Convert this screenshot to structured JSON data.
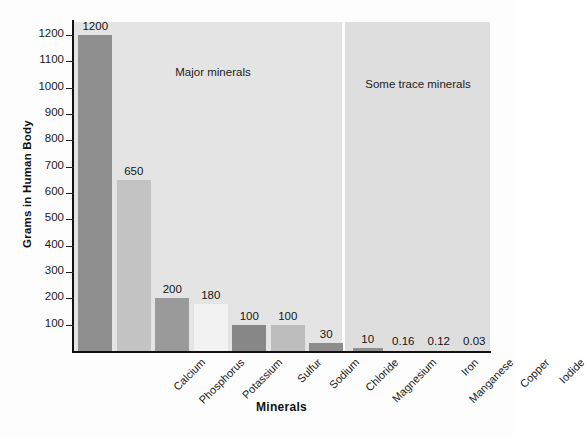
{
  "chart_data": {
    "type": "bar",
    "title": "",
    "xlabel": "Minerals",
    "ylabel": "Grams in Human Body",
    "ylim": [
      0,
      1250
    ],
    "grid": false,
    "legend": "none",
    "ytick_labels": [
      "1200",
      "1100",
      "1000",
      "900",
      "800",
      "700",
      "600",
      "500",
      "400",
      "300",
      "200",
      "100"
    ],
    "ytick_values": [
      1200,
      1100,
      1000,
      900,
      800,
      700,
      600,
      500,
      400,
      300,
      200,
      100
    ],
    "categories": [
      "Calcium",
      "Phosphorus",
      "Potassium",
      "Sulfur",
      "Sodium",
      "Chloride",
      "Magnesium",
      "Iron",
      "Manganese",
      "Copper",
      "Iodide"
    ],
    "values": [
      1200,
      650,
      200,
      180,
      100,
      100,
      30,
      10,
      0.16,
      0.12,
      0.03
    ],
    "value_labels": [
      "1200",
      "650",
      "200",
      "180",
      "100",
      "100",
      "30",
      "10",
      "0.16",
      "0.12",
      "0.03"
    ],
    "bar_colors": [
      "#8f8f8f",
      "#c3c3c3",
      "#9a9a9a",
      "#f2f2f2",
      "#878787",
      "#bcbcbc",
      "#8d8d8d",
      "#8f8f8f",
      "#c3c3c3",
      "#9a9a9a",
      "#f2f2f2"
    ],
    "annotations": [
      {
        "text": "Major minerals",
        "group": "major"
      },
      {
        "text": "Some trace minerals",
        "group": "trace"
      }
    ],
    "groups": [
      {
        "name": "Major minerals",
        "categories": [
          "Calcium",
          "Phosphorus",
          "Potassium",
          "Sulfur",
          "Sodium",
          "Chloride",
          "Magnesium"
        ]
      },
      {
        "name": "Some trace minerals",
        "categories": [
          "Iron",
          "Manganese",
          "Copper",
          "Iodide"
        ]
      }
    ]
  },
  "colors": {
    "plot_background": "#e4e4e4",
    "trace_band_background": "#dedede",
    "axis": "#111111",
    "text": "#1a1a1a",
    "page_background": "#fdfdfd"
  }
}
